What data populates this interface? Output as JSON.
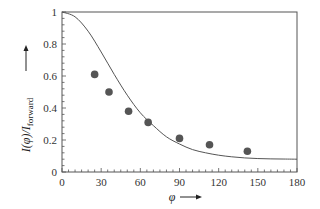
{
  "chart_data": {
    "type": "scatter",
    "title": "",
    "xlabel": "φ",
    "ylabel": "I(φ)/I_forward",
    "ylabel_main": "I(φ)/I",
    "ylabel_sub": "forward",
    "xlim": [
      0,
      180
    ],
    "ylim": [
      0,
      1
    ],
    "x_ticks": [
      0,
      30,
      60,
      90,
      120,
      150,
      180
    ],
    "y_ticks": [
      0,
      0.2,
      0.4,
      0.6,
      0.8,
      1
    ],
    "y_tick_labels": [
      "0",
      "0.2",
      "0.4",
      "0.6",
      "0.8",
      "1"
    ],
    "grid": false,
    "legend": null,
    "series": [
      {
        "name": "measured",
        "kind": "scatter",
        "color": "#555555",
        "x": [
          25,
          36,
          51,
          66,
          90,
          113,
          142
        ],
        "y": [
          0.61,
          0.5,
          0.38,
          0.31,
          0.21,
          0.17,
          0.13
        ]
      },
      {
        "name": "model",
        "kind": "line",
        "color": "#555555",
        "x": [
          0,
          10,
          20,
          30,
          40,
          50,
          60,
          70,
          80,
          90,
          100,
          110,
          120,
          130,
          140,
          150,
          160,
          170,
          180
        ],
        "y": [
          1.0,
          0.97,
          0.88,
          0.75,
          0.61,
          0.48,
          0.37,
          0.29,
          0.22,
          0.175,
          0.14,
          0.12,
          0.105,
          0.095,
          0.088,
          0.084,
          0.082,
          0.081,
          0.08
        ]
      }
    ]
  }
}
